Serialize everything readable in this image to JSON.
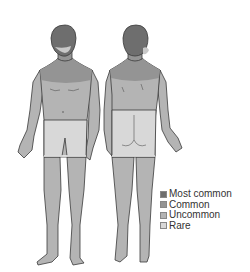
{
  "figure": {
    "views": [
      {
        "name": "front",
        "label": "Anterior view"
      },
      {
        "name": "back",
        "label": "Posterior view"
      }
    ],
    "regions": {
      "head": "most_common",
      "face_lower": "rare",
      "upper_chest_shoulders": "common",
      "trunk_arms": "uncommon",
      "buttocks_groin": "rare",
      "legs": "uncommon",
      "feet": "uncommon"
    }
  },
  "legend": {
    "items": [
      {
        "key": "most_common",
        "label": "Most common",
        "color": "#6e6e6e"
      },
      {
        "key": "common",
        "label": "Common",
        "color": "#949494"
      },
      {
        "key": "uncommon",
        "label": "Uncommon",
        "color": "#b4b4b4"
      },
      {
        "key": "rare",
        "label": "Rare",
        "color": "#d8d8d8"
      }
    ]
  },
  "colors": {
    "most_common": "#6e6e6e",
    "common": "#949494",
    "uncommon": "#b4b4b4",
    "rare": "#d8d8d8",
    "outline": "#3a3a3a"
  }
}
